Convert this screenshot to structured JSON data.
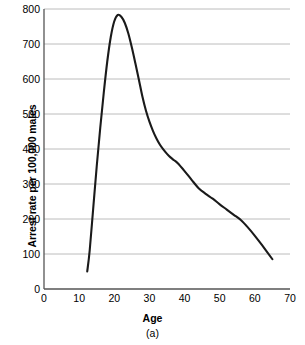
{
  "chart_data": {
    "type": "line",
    "title": "",
    "caption": "(a)",
    "xlabel": "Age",
    "ylabel": "Arrest rate per 100,000 males",
    "xlim": [
      0,
      70
    ],
    "ylim": [
      0,
      800
    ],
    "xticks": [
      0,
      10,
      20,
      30,
      40,
      50,
      60,
      70
    ],
    "yticks": [
      0,
      100,
      200,
      300,
      400,
      500,
      600,
      700,
      800
    ],
    "grid": "horizontal",
    "legend": "none",
    "line_color": "#1a1a1a",
    "grid_color": "#b4b4b4",
    "axis_color": "#555555",
    "series": [
      {
        "name": "Arrest rate",
        "x": [
          12.3,
          13,
          14,
          15,
          16,
          17,
          18,
          19,
          20,
          21,
          22,
          23,
          24,
          25,
          26,
          27,
          28,
          29,
          30,
          31,
          32,
          33,
          34,
          35,
          36,
          37,
          38,
          40,
          42,
          44,
          46,
          48,
          50,
          52,
          54,
          56,
          58,
          60,
          62,
          65
        ],
        "y": [
          50,
          110,
          230,
          350,
          460,
          560,
          650,
          720,
          765,
          783,
          778,
          760,
          730,
          690,
          645,
          598,
          550,
          510,
          478,
          452,
          430,
          412,
          398,
          386,
          376,
          368,
          360,
          337,
          312,
          288,
          272,
          258,
          242,
          227,
          212,
          197,
          176,
          152,
          126,
          85
        ]
      }
    ]
  }
}
